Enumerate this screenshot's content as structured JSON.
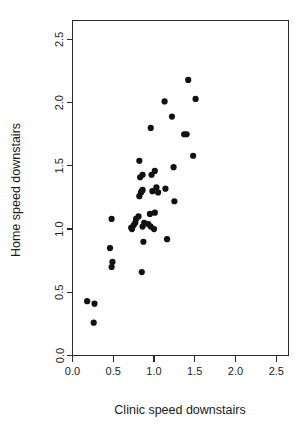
{
  "chart_data": {
    "type": "scatter",
    "title": "",
    "xlabel": "Clinic speed downstairs",
    "ylabel": "Home speed downstairs",
    "xlim": [
      0.0,
      2.65
    ],
    "ylim": [
      0.0,
      2.65
    ],
    "xticks": [
      0.0,
      0.5,
      1.0,
      1.5,
      2.0,
      2.5
    ],
    "xticklabels": [
      "0.0",
      "0.5",
      "1.0",
      "1.5",
      "2.0",
      "2.5"
    ],
    "yticks": [
      0.0,
      0.5,
      1.0,
      1.5,
      2.0,
      2.5
    ],
    "yticklabels": [
      "0.0",
      "0.5",
      "1.0",
      "1.5",
      "2.0",
      "2.5"
    ],
    "grid": false,
    "legend": null,
    "marker": "filled-circle",
    "marker_color": "#111111",
    "marker_size": 3.1,
    "n_points": 46,
    "points": [
      {
        "x": 0.18,
        "y": 0.43
      },
      {
        "x": 0.27,
        "y": 0.41
      },
      {
        "x": 0.26,
        "y": 0.26
      },
      {
        "x": 0.48,
        "y": 1.08
      },
      {
        "x": 0.46,
        "y": 0.85
      },
      {
        "x": 0.49,
        "y": 0.74
      },
      {
        "x": 0.48,
        "y": 0.7
      },
      {
        "x": 0.72,
        "y": 1.01
      },
      {
        "x": 0.73,
        "y": 1.0
      },
      {
        "x": 0.75,
        "y": 1.03
      },
      {
        "x": 0.77,
        "y": 1.05
      },
      {
        "x": 0.78,
        "y": 1.08
      },
      {
        "x": 0.81,
        "y": 1.1
      },
      {
        "x": 0.85,
        "y": 0.66
      },
      {
        "x": 0.87,
        "y": 0.9
      },
      {
        "x": 0.86,
        "y": 1.02
      },
      {
        "x": 0.88,
        "y": 1.05
      },
      {
        "x": 0.93,
        "y": 1.04
      },
      {
        "x": 0.95,
        "y": 1.12
      },
      {
        "x": 0.96,
        "y": 1.02
      },
      {
        "x": 1.0,
        "y": 1.0
      },
      {
        "x": 0.82,
        "y": 1.26
      },
      {
        "x": 0.84,
        "y": 1.29
      },
      {
        "x": 0.85,
        "y": 1.3
      },
      {
        "x": 0.86,
        "y": 1.31
      },
      {
        "x": 0.83,
        "y": 1.41
      },
      {
        "x": 0.86,
        "y": 1.43
      },
      {
        "x": 0.97,
        "y": 1.43
      },
      {
        "x": 0.98,
        "y": 1.3
      },
      {
        "x": 1.03,
        "y": 1.33
      },
      {
        "x": 1.05,
        "y": 1.29
      },
      {
        "x": 1.01,
        "y": 1.46
      },
      {
        "x": 1.14,
        "y": 1.32
      },
      {
        "x": 1.16,
        "y": 0.92
      },
      {
        "x": 1.25,
        "y": 1.22
      },
      {
        "x": 1.24,
        "y": 1.49
      },
      {
        "x": 0.82,
        "y": 1.54
      },
      {
        "x": 0.96,
        "y": 1.8
      },
      {
        "x": 1.13,
        "y": 2.01
      },
      {
        "x": 1.22,
        "y": 1.89
      },
      {
        "x": 1.37,
        "y": 1.75
      },
      {
        "x": 1.4,
        "y": 1.75
      },
      {
        "x": 1.42,
        "y": 2.18
      },
      {
        "x": 1.48,
        "y": 1.58
      },
      {
        "x": 1.51,
        "y": 2.03
      },
      {
        "x": 1.01,
        "y": 1.13
      }
    ]
  },
  "axis": {
    "x_title": "Clinic speed downstairs",
    "y_title": "Home speed downstairs"
  },
  "colors": {
    "background": "#ffffff",
    "axis": "#2b2b2b",
    "point": "#111111",
    "text": "#1a1a1a"
  }
}
